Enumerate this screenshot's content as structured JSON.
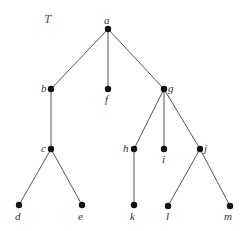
{
  "diagram": {
    "type": "rooted-tree",
    "title": "T",
    "title_pos": [
      44,
      23
    ],
    "nodes": [
      {
        "id": "a",
        "label": "a",
        "x": 108,
        "y": 29,
        "lx": 104,
        "ly": 24
      },
      {
        "id": "b",
        "label": "b",
        "x": 51,
        "y": 89,
        "lx": 41,
        "ly": 92
      },
      {
        "id": "f",
        "label": "f",
        "x": 108,
        "y": 89,
        "lx": 105,
        "ly": 103
      },
      {
        "id": "g",
        "label": "g",
        "x": 164,
        "y": 89,
        "lx": 168,
        "ly": 92
      },
      {
        "id": "c",
        "label": "c",
        "x": 51,
        "y": 149,
        "lx": 41,
        "ly": 152
      },
      {
        "id": "h",
        "label": "h",
        "x": 134,
        "y": 149,
        "lx": 123,
        "ly": 152
      },
      {
        "id": "i",
        "label": "i",
        "x": 164,
        "y": 149,
        "lx": 162,
        "ly": 163
      },
      {
        "id": "j",
        "label": "j",
        "x": 200,
        "y": 149,
        "lx": 204,
        "ly": 152
      },
      {
        "id": "d",
        "label": "d",
        "x": 19,
        "y": 205,
        "lx": 15,
        "ly": 220
      },
      {
        "id": "e",
        "label": "e",
        "x": 82,
        "y": 205,
        "lx": 78,
        "ly": 220
      },
      {
        "id": "k",
        "label": "k",
        "x": 134,
        "y": 205,
        "lx": 130,
        "ly": 220
      },
      {
        "id": "l",
        "label": "l",
        "x": 168,
        "y": 206,
        "lx": 166,
        "ly": 220
      },
      {
        "id": "m",
        "label": "m",
        "x": 230,
        "y": 206,
        "lx": 224,
        "ly": 220
      }
    ],
    "edges": [
      [
        "a",
        "b"
      ],
      [
        "a",
        "f"
      ],
      [
        "a",
        "g"
      ],
      [
        "b",
        "c"
      ],
      [
        "c",
        "d"
      ],
      [
        "c",
        "e"
      ],
      [
        "g",
        "h"
      ],
      [
        "g",
        "i"
      ],
      [
        "g",
        "j"
      ],
      [
        "h",
        "k"
      ],
      [
        "j",
        "l"
      ],
      [
        "j",
        "m"
      ]
    ]
  }
}
